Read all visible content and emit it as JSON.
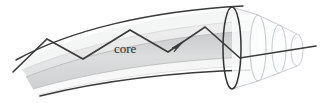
{
  "figure": {
    "name": "optical-fiber-core-diagram",
    "width": 322,
    "height": 103,
    "background_color": "#ffffff"
  },
  "labels": {
    "core": "core"
  },
  "colors": {
    "background": "#ffffff",
    "ray_stroke": "#3a3a3a",
    "outline_dark": "#333333",
    "cylinder_outline": "#b9bdc1",
    "core_band": "#d7d8d9",
    "cladding_band": "#e8e9ea",
    "buffer_band": "#f2f3f3",
    "text": "#2a2a2a"
  },
  "geometry": {
    "core_band": {
      "top_left_y": 36,
      "top_right_y": 25,
      "bottom_left_y": 57,
      "bottom_right_y": 60
    },
    "ray_path_points": [
      [
        13,
        72
      ],
      [
        47,
        39
      ],
      [
        83,
        59
      ],
      [
        130,
        30
      ],
      [
        168,
        52
      ],
      [
        205,
        27
      ],
      [
        240,
        58
      ],
      [
        316,
        46
      ]
    ],
    "arrowhead": {
      "x": 181,
      "y": 44,
      "angle_deg": -33
    },
    "end_face_ellipse": {
      "cx": 232,
      "cy": 48,
      "rx": 9,
      "ry": 41
    },
    "telescoping_cylinders": [
      {
        "cx": 258,
        "cy": 48,
        "rx": 8,
        "ry": 33
      },
      {
        "cx": 279,
        "cy": 49,
        "rx": 7,
        "ry": 24
      },
      {
        "cx": 297,
        "cy": 50,
        "rx": 6,
        "ry": 16
      }
    ]
  },
  "elements": {
    "outer_top_curve": "dark-upper-boundary",
    "outer_bottom_curve": "dark-lower-boundary",
    "ray": "light-ray-total-internal-reflection",
    "core_label": "core"
  }
}
